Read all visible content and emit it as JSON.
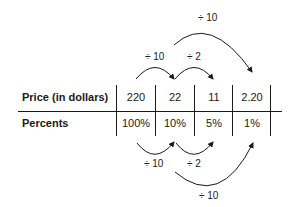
{
  "table": {
    "rows": [
      {
        "label": "Price (in dollars)",
        "values": [
          "220",
          "22",
          "11",
          "2.20"
        ]
      },
      {
        "label": "Percents",
        "values": [
          "100%",
          "10%",
          "5%",
          "1%"
        ]
      }
    ]
  },
  "arrows_top": [
    {
      "label": "÷ 10",
      "from": "220",
      "to": "22"
    },
    {
      "label": "÷ 2",
      "from": "22",
      "to": "11"
    },
    {
      "label": "÷ 10",
      "from": "22",
      "to": "2.20"
    }
  ],
  "arrows_bottom": [
    {
      "label": "÷ 10",
      "from": "100%",
      "to": "10%"
    },
    {
      "label": "÷ 2",
      "from": "10%",
      "to": "5%"
    },
    {
      "label": "÷ 10",
      "from": "10%",
      "to": "1%"
    }
  ]
}
